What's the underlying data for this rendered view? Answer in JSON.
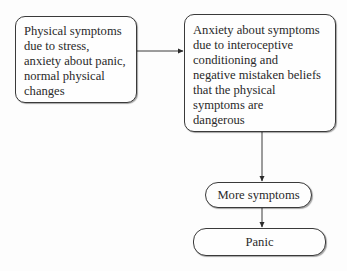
{
  "diagram": {
    "nodes": [
      {
        "id": "trigger",
        "lines": [
          "Physical symptoms",
          "due to stress,",
          "anxiety about panic,",
          "normal physical",
          "changes"
        ]
      },
      {
        "id": "anxiety",
        "lines": [
          "Anxiety about symptoms",
          "due to interoceptive",
          "conditioning and",
          "negative mistaken beliefs",
          "that the physical",
          "symptoms are",
          "dangerous"
        ]
      },
      {
        "id": "more",
        "label": "More symptoms"
      },
      {
        "id": "panic",
        "label": "Panic"
      }
    ],
    "edges": [
      {
        "from": "trigger",
        "to": "anxiety"
      },
      {
        "from": "anxiety",
        "to": "more"
      },
      {
        "from": "more",
        "to": "panic"
      }
    ],
    "colors": {
      "stroke": "#3a3a3a",
      "text": "#2a2a2a",
      "background": "#fdfdfd"
    }
  }
}
